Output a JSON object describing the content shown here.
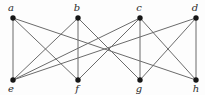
{
  "figure": {
    "background_color": "#fdfdfd",
    "edge_color": "#6b6b6b",
    "node_color": "#161616",
    "label_color": "#2b2b2b",
    "node_radius": 2.7,
    "nodes": [
      {
        "id": "a",
        "label": "a",
        "x": 13,
        "y": 18,
        "label_x": 11,
        "label_y": 11,
        "row": "top"
      },
      {
        "id": "b",
        "label": "b",
        "x": 78,
        "y": 18,
        "label_x": 77,
        "label_y": 11,
        "row": "top"
      },
      {
        "id": "c",
        "label": "c",
        "x": 140,
        "y": 18,
        "label_x": 139,
        "label_y": 11,
        "row": "top"
      },
      {
        "id": "d",
        "label": "d",
        "x": 196,
        "y": 18,
        "label_x": 195,
        "label_y": 11,
        "row": "top"
      },
      {
        "id": "e",
        "label": "e",
        "x": 13,
        "y": 80,
        "label_x": 11,
        "label_y": 92,
        "row": "bottom"
      },
      {
        "id": "f",
        "label": "f",
        "x": 78,
        "y": 80,
        "label_x": 77,
        "label_y": 92,
        "row": "bottom"
      },
      {
        "id": "g",
        "label": "g",
        "x": 140,
        "y": 80,
        "label_x": 139,
        "label_y": 92,
        "row": "bottom"
      },
      {
        "id": "h",
        "label": "h",
        "x": 196,
        "y": 80,
        "label_x": 196,
        "label_y": 92,
        "row": "bottom"
      }
    ],
    "edges": [
      [
        "a",
        "e"
      ],
      [
        "a",
        "f"
      ],
      [
        "a",
        "h"
      ],
      [
        "b",
        "e"
      ],
      [
        "b",
        "f"
      ],
      [
        "b",
        "g"
      ],
      [
        "c",
        "e"
      ],
      [
        "c",
        "f"
      ],
      [
        "c",
        "g"
      ],
      [
        "c",
        "h"
      ],
      [
        "d",
        "e"
      ],
      [
        "d",
        "g"
      ],
      [
        "d",
        "h"
      ]
    ]
  }
}
